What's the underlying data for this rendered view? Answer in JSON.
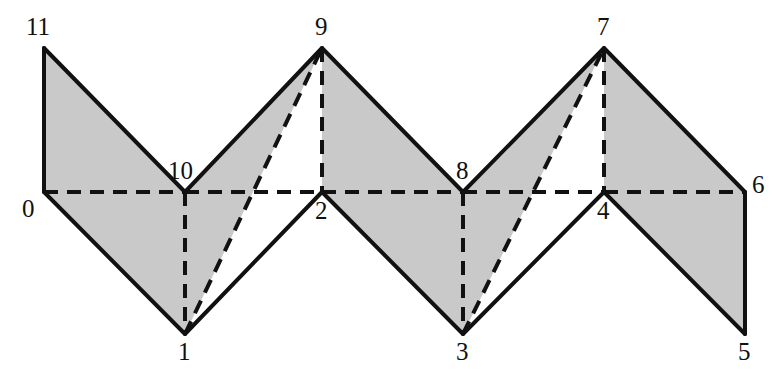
{
  "figure": {
    "kind": "geometric-diagram",
    "width": 775,
    "height": 373,
    "background_color": "#ffffff",
    "fill_color": "#c9c9c9",
    "stroke_color": "#111111",
    "solid_stroke_width": 4,
    "dashed_stroke_width": 4,
    "dash_pattern": "14 9"
  },
  "vertices": [
    {
      "id": "0",
      "x": 44,
      "y": 192,
      "label": "0",
      "label_x": 22,
      "label_y": 196
    },
    {
      "id": "1",
      "x": 185,
      "y": 334,
      "label": "1",
      "label_x": 178,
      "label_y": 339
    },
    {
      "id": "2",
      "x": 322,
      "y": 192,
      "label": "2",
      "label_x": 315,
      "label_y": 198
    },
    {
      "id": "3",
      "x": 463,
      "y": 334,
      "label": "3",
      "label_x": 456,
      "label_y": 339
    },
    {
      "id": "4",
      "x": 604,
      "y": 192,
      "label": "4",
      "label_x": 597,
      "label_y": 198
    },
    {
      "id": "5",
      "x": 745,
      "y": 334,
      "label": "5",
      "label_x": 738,
      "label_y": 339
    },
    {
      "id": "6",
      "x": 745,
      "y": 192,
      "label": "6",
      "label_x": 752,
      "label_y": 172
    },
    {
      "id": "7",
      "x": 604,
      "y": 48,
      "label": "7",
      "label_x": 597,
      "label_y": 14
    },
    {
      "id": "8",
      "x": 463,
      "y": 192,
      "label": "8",
      "label_x": 456,
      "label_y": 158
    },
    {
      "id": "9",
      "x": 322,
      "y": 48,
      "label": "9",
      "label_x": 315,
      "label_y": 14
    },
    {
      "id": "10",
      "x": 185,
      "y": 192,
      "label": "10",
      "label_x": 168,
      "label_y": 158
    },
    {
      "id": "11",
      "x": 44,
      "y": 48,
      "label": "11",
      "label_x": 26,
      "label_y": 14
    }
  ],
  "filled_regions": [
    {
      "name": "region-11-0-10",
      "points": "44,48 44,192 185,192"
    },
    {
      "name": "region-0-1-10",
      "points": "44,192 185,334 185,192"
    },
    {
      "name": "region-10-1-9",
      "points": "185,192 185,334 322,48"
    },
    {
      "name": "region-9-2-8",
      "points": "322,48 322,192 463,192"
    },
    {
      "name": "region-2-3-8",
      "points": "322,192 463,334 463,192"
    },
    {
      "name": "region-8-3-7",
      "points": "463,192 463,334 604,48"
    },
    {
      "name": "region-7-4-6",
      "points": "604,48 604,192 745,192"
    },
    {
      "name": "region-4-5-6",
      "points": "604,192 745,334 745,192"
    }
  ],
  "solid_edges": [
    {
      "name": "edge-11-0",
      "from": "11",
      "to": "0",
      "x1": 44,
      "y1": 48,
      "x2": 44,
      "y2": 192
    },
    {
      "name": "edge-11-10",
      "from": "11",
      "to": "10",
      "x1": 44,
      "y1": 48,
      "x2": 185,
      "y2": 192
    },
    {
      "name": "edge-10-9",
      "from": "10",
      "to": "9",
      "x1": 185,
      "y1": 192,
      "x2": 322,
      "y2": 48
    },
    {
      "name": "edge-9-8",
      "from": "9",
      "to": "8",
      "x1": 322,
      "y1": 48,
      "x2": 463,
      "y2": 192
    },
    {
      "name": "edge-8-7",
      "from": "8",
      "to": "7",
      "x1": 463,
      "y1": 192,
      "x2": 604,
      "y2": 48
    },
    {
      "name": "edge-7-6",
      "from": "7",
      "to": "6",
      "x1": 604,
      "y1": 48,
      "x2": 745,
      "y2": 192
    },
    {
      "name": "edge-6-5",
      "from": "6",
      "to": "5",
      "x1": 745,
      "y1": 192,
      "x2": 745,
      "y2": 334
    },
    {
      "name": "edge-5-4",
      "from": "5",
      "to": "4",
      "x1": 745,
      "y1": 334,
      "x2": 604,
      "y2": 192
    },
    {
      "name": "edge-4-3",
      "from": "4",
      "to": "3",
      "x1": 604,
      "y1": 192,
      "x2": 463,
      "y2": 334
    },
    {
      "name": "edge-3-2",
      "from": "3",
      "to": "2",
      "x1": 463,
      "y1": 334,
      "x2": 322,
      "y2": 192
    },
    {
      "name": "edge-2-1",
      "from": "2",
      "to": "1",
      "x1": 322,
      "y1": 192,
      "x2": 185,
      "y2": 334
    },
    {
      "name": "edge-1-0",
      "from": "1",
      "to": "0",
      "x1": 185,
      "y1": 334,
      "x2": 44,
      "y2": 192
    }
  ],
  "dashed_edges": [
    {
      "name": "edge-0-10",
      "from": "0",
      "to": "10",
      "x1": 44,
      "y1": 192,
      "x2": 185,
      "y2": 192
    },
    {
      "name": "edge-10-2",
      "from": "10",
      "to": "2",
      "x1": 185,
      "y1": 192,
      "x2": 322,
      "y2": 192
    },
    {
      "name": "edge-2-8",
      "from": "2",
      "to": "8",
      "x1": 322,
      "y1": 192,
      "x2": 463,
      "y2": 192
    },
    {
      "name": "edge-8-4",
      "from": "8",
      "to": "4",
      "x1": 463,
      "y1": 192,
      "x2": 604,
      "y2": 192
    },
    {
      "name": "edge-4-6",
      "from": "4",
      "to": "6",
      "x1": 604,
      "y1": 192,
      "x2": 745,
      "y2": 192
    },
    {
      "name": "edge-10-1",
      "from": "10",
      "to": "1",
      "x1": 185,
      "y1": 192,
      "x2": 185,
      "y2": 334
    },
    {
      "name": "edge-9-2",
      "from": "9",
      "to": "2",
      "x1": 322,
      "y1": 48,
      "x2": 322,
      "y2": 192
    },
    {
      "name": "edge-8-3",
      "from": "8",
      "to": "3",
      "x1": 463,
      "y1": 192,
      "x2": 463,
      "y2": 334
    },
    {
      "name": "edge-7-4",
      "from": "7",
      "to": "4",
      "x1": 604,
      "y1": 48,
      "x2": 604,
      "y2": 192
    },
    {
      "name": "edge-1-9",
      "from": "1",
      "to": "9",
      "x1": 185,
      "y1": 334,
      "x2": 322,
      "y2": 48
    },
    {
      "name": "edge-3-7",
      "from": "3",
      "to": "7",
      "x1": 463,
      "y1": 334,
      "x2": 604,
      "y2": 48
    }
  ]
}
